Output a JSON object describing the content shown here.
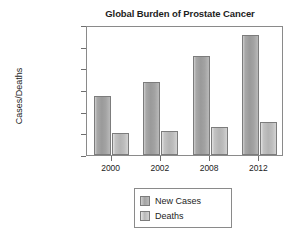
{
  "chart_data": {
    "type": "bar",
    "title": "Global Burden of Prostate Cancer",
    "xlabel": "",
    "ylabel": "Cases/Deaths",
    "categories": [
      "2000",
      "2002",
      "2008",
      "2012"
    ],
    "series": [
      {
        "name": "New Cases",
        "values": [
          545000,
          675000,
          910000,
          1105000
        ],
        "color": "#a3a3a3"
      },
      {
        "name": "Deaths",
        "values": [
          205000,
          225000,
          255000,
          305000
        ],
        "color": "#c2c2c2"
      }
    ],
    "ylim": [
      0,
      1200000
    ],
    "ytick_values": [
      0,
      200000,
      400000,
      600000,
      800000,
      1000000,
      1200000
    ],
    "ytick_labels": [
      "0",
      "200,000",
      "400,000",
      "600,000",
      "800,000",
      "1,000,000",
      "1,200,000"
    ],
    "grid": false,
    "legend_position": "bottom-center",
    "legend_entries": [
      "New Cases",
      "Deaths"
    ]
  }
}
